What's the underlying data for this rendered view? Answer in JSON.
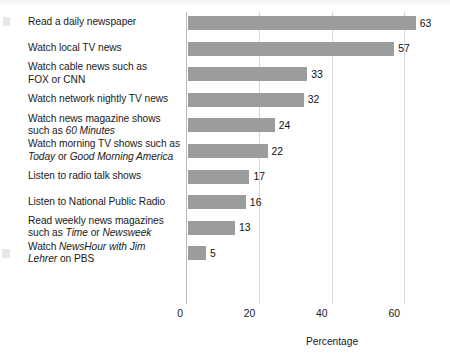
{
  "chart_data": {
    "type": "bar",
    "orientation": "horizontal",
    "title": "",
    "xlabel": "Percentage",
    "ylabel": "",
    "xlim": [
      0,
      72
    ],
    "xticks": [
      0,
      20,
      40,
      60
    ],
    "xtick_labels": [
      "0",
      "20",
      "40",
      "60"
    ],
    "grid": "vertical-gridlines-only",
    "legend": "none",
    "bar_color": "#9b9c9d",
    "categories": [
      "Read a daily newspaper",
      "Watch local TV news",
      "Watch cable news such as FOX or CNN",
      "Watch network nightly TV news",
      "Watch news magazine shows such as 60 Minutes",
      "Watch morning TV shows such as Today or Good Morning America",
      "Listen to radio talk shows",
      "Listen to National Public Radio",
      "Read weekly news magazines such as Time or Newsweek",
      "Watch NewsHour with Jim Lehrer on PBS"
    ],
    "values": [
      63,
      57,
      33,
      32,
      24,
      22,
      17,
      16,
      13,
      5
    ],
    "value_labels": [
      "63",
      "57",
      "33",
      "32",
      "24",
      "22",
      "17",
      "16",
      "13",
      "5"
    ]
  },
  "labels": [
    {
      "lines": [
        [
          {
            "t": "Read a daily newspaper",
            "i": false
          }
        ]
      ]
    },
    {
      "lines": [
        [
          {
            "t": "Watch local TV news",
            "i": false
          }
        ]
      ]
    },
    {
      "lines": [
        [
          {
            "t": "Watch cable news such as",
            "i": false
          }
        ],
        [
          {
            "t": "FOX or CNN",
            "i": false
          }
        ]
      ]
    },
    {
      "lines": [
        [
          {
            "t": "Watch network nightly TV news",
            "i": false
          }
        ]
      ]
    },
    {
      "lines": [
        [
          {
            "t": "Watch news magazine shows",
            "i": false
          }
        ],
        [
          {
            "t": "such as ",
            "i": false
          },
          {
            "t": "60 Minutes",
            "i": true
          }
        ]
      ]
    },
    {
      "lines": [
        [
          {
            "t": "Watch morning TV shows such as",
            "i": false
          }
        ],
        [
          {
            "t": "Today",
            "i": true
          },
          {
            "t": " or ",
            "i": false
          },
          {
            "t": "Good Morning America",
            "i": true
          }
        ]
      ]
    },
    {
      "lines": [
        [
          {
            "t": "Listen to radio talk shows",
            "i": false
          }
        ]
      ]
    },
    {
      "lines": [
        [
          {
            "t": "Listen to National Public Radio",
            "i": false
          }
        ]
      ]
    },
    {
      "lines": [
        [
          {
            "t": "Read weekly news magazines",
            "i": false
          }
        ],
        [
          {
            "t": "such as ",
            "i": false
          },
          {
            "t": "Time",
            "i": true
          },
          {
            "t": " or ",
            "i": false
          },
          {
            "t": "Newsweek",
            "i": true
          }
        ]
      ]
    },
    {
      "lines": [
        [
          {
            "t": "Watch ",
            "i": false
          },
          {
            "t": "NewsHour with Jim",
            "i": true
          }
        ],
        [
          {
            "t": "Lehrer",
            "i": true
          },
          {
            "t": " on PBS",
            "i": false
          }
        ]
      ]
    }
  ],
  "axis": {
    "title": "Percentage"
  }
}
